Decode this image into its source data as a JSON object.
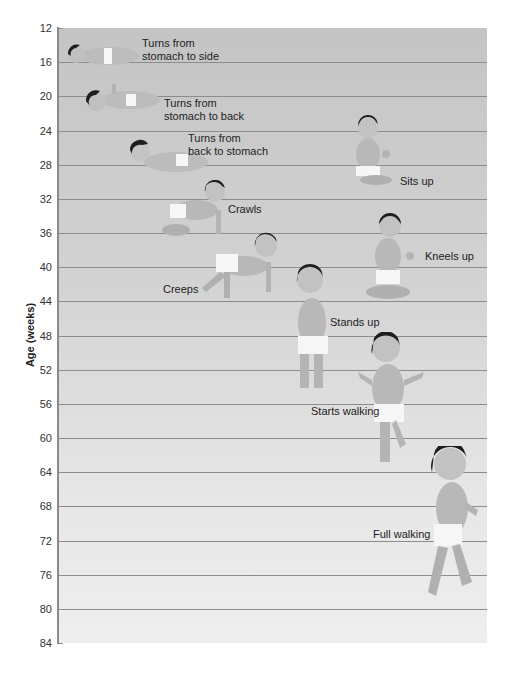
{
  "chart_data": {
    "type": "scatter",
    "title": "",
    "ylabel": "Age (weeks)",
    "xlabel": "",
    "ylim": [
      12,
      84
    ],
    "y_inverted": true,
    "yticks": [
      12,
      16,
      20,
      24,
      28,
      32,
      36,
      40,
      44,
      48,
      52,
      56,
      60,
      64,
      68,
      72,
      76,
      80,
      84
    ],
    "grid": true,
    "milestones": [
      {
        "label": "Turns from stomach to side",
        "age_weeks": 15
      },
      {
        "label": "Turns from stomach to back",
        "age_weeks": 20
      },
      {
        "label": "Turns from back to stomach",
        "age_weeks": 26
      },
      {
        "label": "Sits up",
        "age_weeks": 28
      },
      {
        "label": "Crawls",
        "age_weeks": 33
      },
      {
        "label": "Kneels up",
        "age_weeks": 38
      },
      {
        "label": "Creeps",
        "age_weeks": 41
      },
      {
        "label": "Stands up",
        "age_weeks": 46
      },
      {
        "label": "Starts walking",
        "age_weeks": 58
      },
      {
        "label": "Full walking",
        "age_weeks": 73
      }
    ]
  },
  "axis": {
    "ylabel": "Age (weeks)",
    "ticks": [
      "12",
      "16",
      "20",
      "24",
      "28",
      "32",
      "36",
      "40",
      "44",
      "48",
      "52",
      "56",
      "60",
      "64",
      "68",
      "72",
      "76",
      "80",
      "84"
    ]
  },
  "labels": {
    "turns_side": "Turns from\nstomach to side",
    "turns_back": "Turns from\nstomach to back",
    "turns_stomach": "Turns from\nback to stomach",
    "sits_up": "Sits up",
    "crawls": "Crawls",
    "kneels_up": "Kneels up",
    "creeps": "Creeps",
    "stands_up": "Stands up",
    "starts_walking": "Starts walking",
    "full_walking": "Full walking"
  },
  "colors": {
    "hair": "#1e1e1e",
    "skin": "#b9b9b9",
    "skin_shadow": "#a2a2a2",
    "diaper": "#f6f6f6"
  }
}
